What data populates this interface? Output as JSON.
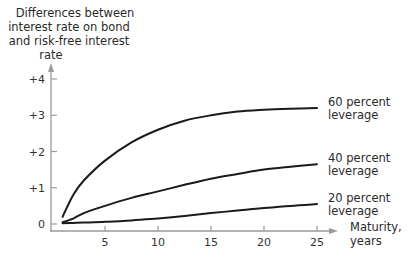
{
  "chart_data": {
    "type": "line",
    "title": "",
    "ylabel": "Differences between interest rate on bond and risk-free interest rate",
    "ylabel_lines": [
      "Differences between",
      "interest rate on bond",
      "and risk-free interest",
      "rate"
    ],
    "xlabel": "Maturity, years",
    "xlabel_lines": [
      "Maturity,",
      "years"
    ],
    "x_ticks": [
      5,
      10,
      15,
      20,
      25
    ],
    "x_tick_labels": [
      "5",
      "10",
      "15",
      "20",
      "25"
    ],
    "y_ticks": [
      0,
      1,
      2,
      3,
      4
    ],
    "y_tick_labels": [
      "0",
      "+1",
      "+2",
      "+3",
      "+4"
    ],
    "xlim": [
      0,
      27
    ],
    "ylim": [
      0,
      4.3
    ],
    "grid": false,
    "legend_position": "inline-right",
    "x": [
      1,
      2,
      3,
      5,
      7.5,
      10,
      12.5,
      15,
      17.5,
      20,
      22.5,
      25
    ],
    "series": [
      {
        "name": "60 percent leverage",
        "label_lines": [
          "60 percent",
          "leverage"
        ],
        "values": [
          0.2,
          0.8,
          1.2,
          1.75,
          2.25,
          2.6,
          2.85,
          3.0,
          3.1,
          3.15,
          3.18,
          3.2
        ]
      },
      {
        "name": "40 percent leverage",
        "label_lines": [
          "40 percent",
          "leverage"
        ],
        "values": [
          0.05,
          0.15,
          0.3,
          0.5,
          0.72,
          0.9,
          1.08,
          1.25,
          1.38,
          1.5,
          1.58,
          1.65
        ]
      },
      {
        "name": "20 percent leverage",
        "label_lines": [
          "20 percent",
          "leverage"
        ],
        "values": [
          0.02,
          0.03,
          0.04,
          0.06,
          0.1,
          0.15,
          0.22,
          0.3,
          0.37,
          0.44,
          0.5,
          0.55
        ]
      }
    ]
  }
}
